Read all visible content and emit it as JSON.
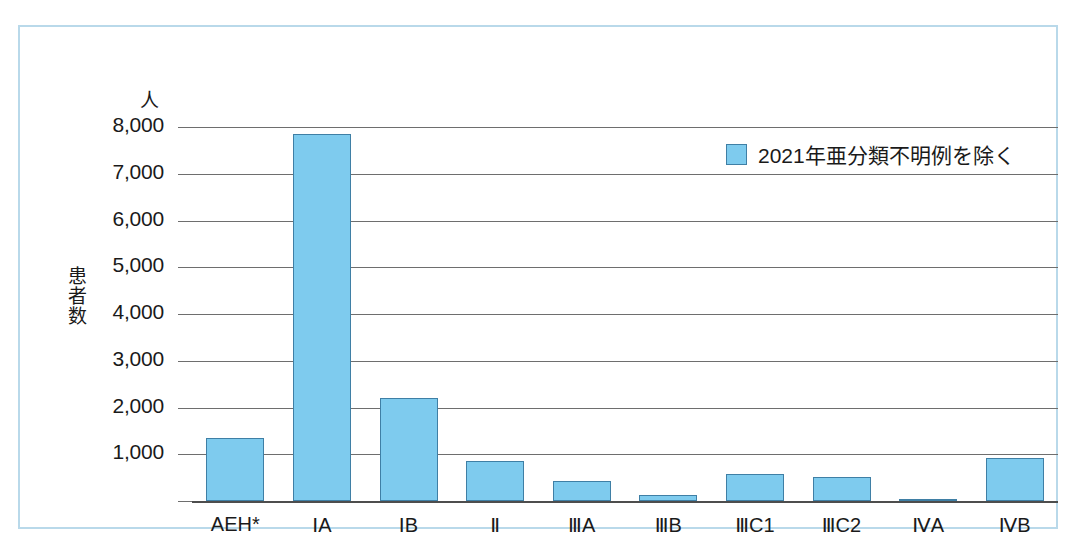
{
  "chart_data": {
    "type": "bar",
    "title": "",
    "subtitle": "",
    "unit_label": "人",
    "ylabel": "患者数",
    "xlabel": "",
    "categories": [
      "AEH*",
      "ⅠA",
      "ⅠB",
      "Ⅱ",
      "ⅢA",
      "ⅢB",
      "ⅢC1",
      "ⅢC2",
      "ⅣA",
      "ⅣB"
    ],
    "values": [
      1340,
      7850,
      2200,
      850,
      430,
      130,
      580,
      520,
      40,
      930
    ],
    "series": [
      {
        "name": "2021年亜分類不明例を除く",
        "values": [
          1340,
          7850,
          2200,
          850,
          430,
          130,
          580,
          520,
          40,
          930
        ],
        "color": "#7ecbee"
      }
    ],
    "ylim": [
      0,
      8000
    ],
    "ytick_values": [
      1000,
      2000,
      3000,
      4000,
      5000,
      6000,
      7000,
      8000
    ],
    "ytick_labels": [
      "1,000",
      "2,000",
      "3,000",
      "4,000",
      "5,000",
      "6,000",
      "7,000",
      "8,000"
    ],
    "grid": true,
    "grid_axis": "y",
    "legend_position": "top-right",
    "legend_entries": [
      "2021年亜分類不明例を除く"
    ],
    "annotations": []
  },
  "legend": {
    "label": "2021年亜分類不明例を除く"
  },
  "axes": {
    "unit": "人",
    "y_title_chars": [
      "患",
      "者",
      "数"
    ]
  },
  "colors": {
    "bar_fill": "#7ecbee",
    "bar_stroke": "#3f7fa5",
    "gridline": "#6e6e6e",
    "frame": "#b9d9ea",
    "text": "#1a1a1a"
  }
}
